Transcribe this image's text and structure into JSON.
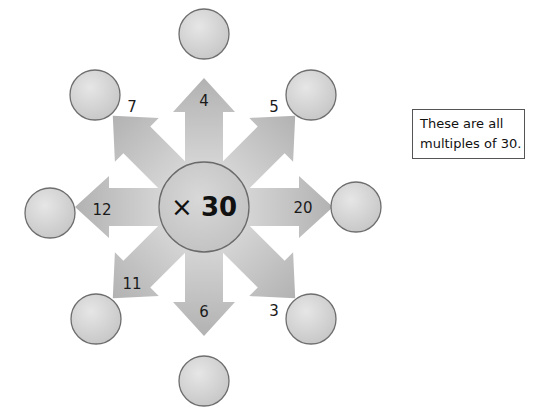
{
  "diagram": {
    "center": {
      "operator": "×",
      "multiplier": "30",
      "x": 204,
      "y": 207,
      "r": 45
    },
    "arrows": [
      {
        "direction": "up",
        "angle": -90,
        "label": "4",
        "label_x": 204,
        "label_y": 106
      },
      {
        "direction": "up-right",
        "angle": -45,
        "label": "5",
        "label_x": 274,
        "label_y": 112
      },
      {
        "direction": "right",
        "angle": 0,
        "label": "20",
        "label_x": 303,
        "label_y": 213
      },
      {
        "direction": "down-right",
        "angle": 45,
        "label": "3",
        "label_x": 274,
        "label_y": 316
      },
      {
        "direction": "down",
        "angle": 90,
        "label": "6",
        "label_x": 204,
        "label_y": 317
      },
      {
        "direction": "down-left",
        "angle": 135,
        "label": "11",
        "label_x": 132,
        "label_y": 289
      },
      {
        "direction": "left",
        "angle": 180,
        "label": "12",
        "label_x": 102,
        "label_y": 215
      },
      {
        "direction": "up-left",
        "angle": -135,
        "label": "7",
        "label_x": 132,
        "label_y": 112
      }
    ],
    "answer_circles": [
      {
        "position": "top",
        "x": 204,
        "y": 34,
        "value": ""
      },
      {
        "position": "top-right",
        "x": 311,
        "y": 95,
        "value": ""
      },
      {
        "position": "right",
        "x": 356,
        "y": 207,
        "value": ""
      },
      {
        "position": "bottom-right",
        "x": 311,
        "y": 319,
        "value": ""
      },
      {
        "position": "bottom",
        "x": 204,
        "y": 381,
        "value": ""
      },
      {
        "position": "bottom-left",
        "x": 96,
        "y": 319,
        "value": ""
      },
      {
        "position": "left",
        "x": 50,
        "y": 213,
        "value": ""
      },
      {
        "position": "top-left",
        "x": 95,
        "y": 95,
        "value": ""
      }
    ],
    "colors": {
      "arrow_light": "#dcdcdc",
      "arrow_dark": "#b4b4b4",
      "circle_fill": "#d6d6d6",
      "circle_border": "#6e6e6e"
    }
  },
  "note": {
    "line1": "These are all",
    "line2": "multiples of 30."
  }
}
